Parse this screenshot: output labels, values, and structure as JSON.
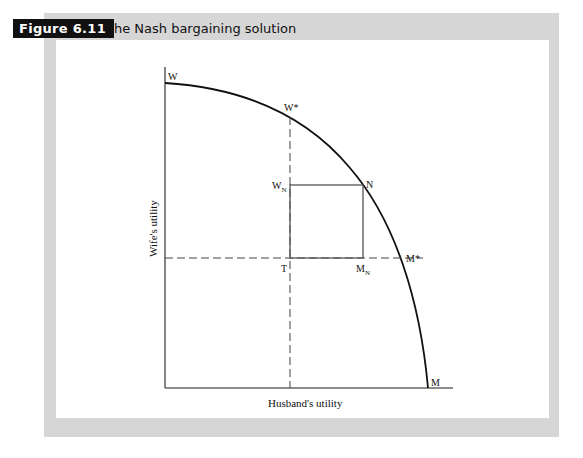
{
  "figure": {
    "label": "Figure 6.11",
    "title": "The Nash bargaining solution"
  },
  "diagram": {
    "x_axis_title": "Husband's utility",
    "y_axis_title": "Wife's utility",
    "points": {
      "W": "W",
      "W_star": "W*",
      "W_N": "W",
      "W_N_sub": "N",
      "N": "N",
      "M_star": "M*",
      "T": "T",
      "M_N": "M",
      "M_N_sub": "N",
      "M": "M"
    },
    "colors": {
      "frame": "#d6d6d6",
      "label_bg": "#111111",
      "line": "#111111",
      "box": "#555555"
    }
  }
}
